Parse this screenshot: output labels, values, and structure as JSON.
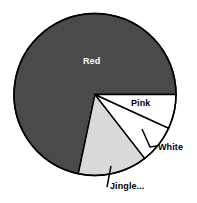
{
  "chart_data": {
    "type": "pie",
    "title": "",
    "subtitle": "",
    "xlabel": "",
    "ylabel": "",
    "grid": false,
    "legend_position": "none",
    "label_style": "inline-with-leader-lines",
    "start_angle_deg": 0,
    "direction": "clockwise",
    "center_px": [
      95,
      94.5
    ],
    "radius_px": 81,
    "categories": [
      "Pink",
      "White",
      "Jingle...",
      "Red"
    ],
    "values": [
      6.8,
      7.6,
      13.8,
      71.7
    ],
    "value_unit": "percent",
    "slices": [
      {
        "label": "Pink",
        "value": 6.8,
        "start_angle_deg": 0,
        "end_angle_deg": 24.6,
        "color": "#ffffff",
        "edge_color": "#000000",
        "label_color": "#000000",
        "label_placement": "inside",
        "leader_line": false
      },
      {
        "label": "White",
        "value": 7.6,
        "start_angle_deg": 24.6,
        "end_angle_deg": 52.1,
        "color": "#ffffff",
        "edge_color": "#000000",
        "label_color": "#000000",
        "label_placement": "outside",
        "leader_line": true
      },
      {
        "label": "Jingle...",
        "value": 13.8,
        "start_angle_deg": 52.1,
        "end_angle_deg": 101.9,
        "color": "#d9d9d9",
        "edge_color": "#000000",
        "label_color": "#000000",
        "label_placement": "outside",
        "leader_line": true
      },
      {
        "label": "Red",
        "value": 71.7,
        "start_angle_deg": 101.9,
        "end_angle_deg": 360,
        "color": "#4a4a4a",
        "edge_color": "#000000",
        "label_color": "#ffffff",
        "label_placement": "inside",
        "leader_line": false
      }
    ]
  },
  "colors": {
    "background": "#ffffff",
    "outline": "#000000",
    "slice_red": "#4a4a4a",
    "slice_jingle": "#d9d9d9",
    "slice_white": "#ffffff",
    "slice_pink": "#ffffff",
    "label_light": "#ffffff",
    "label_dark": "#000000"
  },
  "labels": {
    "red": "Red",
    "pink": "Pink",
    "white": "White",
    "jingle": "Jingle..."
  }
}
